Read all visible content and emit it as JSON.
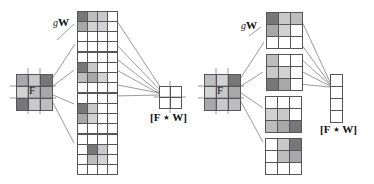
{
  "figure": {
    "caption_labels": {
      "weights": "W",
      "weights_prefix": "g",
      "input": "F",
      "output": "[F ⋆ W]"
    },
    "palette": {
      "white": "#ffffff",
      "light_gray": "#d2d2d2",
      "mid_gray": "#a8a8a8",
      "dark_gray": "#777777",
      "line": "#55555a",
      "text": "#111111"
    }
  },
  "panels": [
    {
      "name": "left-panel",
      "input": {
        "label": "F",
        "rows": 3,
        "cols": 3,
        "cells": [
          [
            "#a8a8a8",
            "#c9c9c9",
            "#777777"
          ],
          [
            "#d2d2d2",
            "#bdbdbd",
            "#a8a8a8"
          ],
          [
            "#777777",
            "#c9c9c9",
            "#bdbdbd"
          ]
        ]
      },
      "kernels": {
        "label_prefix": "g",
        "label": "W",
        "rows": 4,
        "cols": 4,
        "count": 4,
        "stack": [
          {
            "name": "kernel-1",
            "cells": [
              [
                "#777777",
                "#bdbdbd",
                "#c9c9c9",
                "#ffffff"
              ],
              [
                "#a8a8a8",
                "#d2d2d2",
                "#d2d2d2",
                "#ffffff"
              ],
              [
                "#ffffff",
                "#ffffff",
                "#ffffff",
                "#ffffff"
              ],
              [
                "#ffffff",
                "#ffffff",
                "#ffffff",
                "#ffffff"
              ]
            ]
          },
          {
            "name": "kernel-2",
            "cells": [
              [
                "#ffffff",
                "#ffffff",
                "#ffffff",
                "#ffffff"
              ],
              [
                "#777777",
                "#c9c9c9",
                "#ffffff",
                "#ffffff"
              ],
              [
                "#bdbdbd",
                "#a8a8a8",
                "#d2d2d2",
                "#ffffff"
              ],
              [
                "#ffffff",
                "#ffffff",
                "#ffffff",
                "#ffffff"
              ]
            ]
          },
          {
            "name": "kernel-3",
            "cells": [
              [
                "#ffffff",
                "#ffffff",
                "#ffffff",
                "#ffffff"
              ],
              [
                "#777777",
                "#c9c9c9",
                "#ffffff",
                "#ffffff"
              ],
              [
                "#a8a8a8",
                "#d2d2d2",
                "#ffffff",
                "#ffffff"
              ],
              [
                "#ffffff",
                "#ffffff",
                "#ffffff",
                "#ffffff"
              ]
            ]
          },
          {
            "name": "kernel-4",
            "cells": [
              [
                "#ffffff",
                "#ffffff",
                "#ffffff",
                "#ffffff"
              ],
              [
                "#ffffff",
                "#777777",
                "#c9c9c9",
                "#ffffff"
              ],
              [
                "#ffffff",
                "#bdbdbd",
                "#d2d2d2",
                "#ffffff"
              ],
              [
                "#ffffff",
                "#ffffff",
                "#ffffff",
                "#ffffff"
              ]
            ]
          }
        ]
      },
      "output": {
        "label": "[F ⋆ W]",
        "rows": 2,
        "cols": 2,
        "cells": [
          [
            "#ffffff",
            "#ffffff"
          ],
          [
            "#ffffff",
            "#ffffff"
          ]
        ]
      }
    },
    {
      "name": "right-panel",
      "input": {
        "label": "F",
        "rows": 3,
        "cols": 3,
        "cells": [
          [
            "#bdbdbd",
            "#d2d2d2",
            "#777777"
          ],
          [
            "#d2d2d2",
            "#c9c9c9",
            "#a8a8a8"
          ],
          [
            "#a8a8a8",
            "#c9c9c9",
            "#bdbdbd"
          ]
        ]
      },
      "kernels": {
        "label_prefix": "g",
        "label": "W",
        "rows": 3,
        "cols": 3,
        "count": 4,
        "stack": [
          {
            "name": "kernel-1",
            "cells": [
              [
                "#777777",
                "#c9c9c9",
                "#bdbdbd"
              ],
              [
                "#a8a8a8",
                "#d2d2d2",
                "#ffffff"
              ],
              [
                "#ffffff",
                "#ffffff",
                "#ffffff"
              ]
            ]
          },
          {
            "name": "kernel-2",
            "cells": [
              [
                "#bdbdbd",
                "#ffffff",
                "#ffffff"
              ],
              [
                "#c9c9c9",
                "#d2d2d2",
                "#ffffff"
              ],
              [
                "#777777",
                "#a8a8a8",
                "#ffffff"
              ]
            ]
          },
          {
            "name": "kernel-3",
            "cells": [
              [
                "#ffffff",
                "#ffffff",
                "#ffffff"
              ],
              [
                "#d2d2d2",
                "#c9c9c9",
                "#ffffff"
              ],
              [
                "#bdbdbd",
                "#a8a8a8",
                "#777777"
              ]
            ]
          },
          {
            "name": "kernel-4",
            "cells": [
              [
                "#ffffff",
                "#c9c9c9",
                "#777777"
              ],
              [
                "#ffffff",
                "#bdbdbd",
                "#a8a8a8"
              ],
              [
                "#ffffff",
                "#ffffff",
                "#ffffff"
              ]
            ]
          }
        ]
      },
      "output": {
        "label": "[F ⋆ W]",
        "rows": 4,
        "cols": 1,
        "cells": [
          [
            "#ffffff"
          ],
          [
            "#ffffff"
          ],
          [
            "#ffffff"
          ],
          [
            "#ffffff"
          ]
        ]
      }
    }
  ]
}
